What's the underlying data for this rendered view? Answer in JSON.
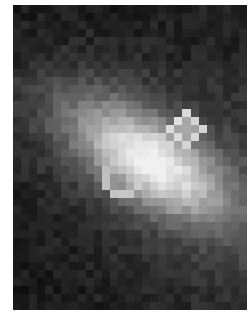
{
  "image": {
    "description": "Pixelated grayscale astronomical image of an elongated galaxy tilted from lower-left to upper-right, with a bright core showing ring-like knots",
    "cols": 29,
    "rows": 38,
    "background_gray": 12,
    "noise_amplitude": 26,
    "galaxy": {
      "center_col": 17.0,
      "center_row": 19.5,
      "major_axis": 13.5,
      "minor_axis": 6.0,
      "angle_deg": -32,
      "peak_gray": 175,
      "halo_gray": 70
    },
    "knots": [
      {
        "col": 21.5,
        "row": 15.5,
        "r": 1.6,
        "rim_gray": 225,
        "inner_gray": 160
      },
      {
        "col": 17.5,
        "row": 18.5,
        "r": 1.8,
        "rim_gray": 215,
        "inner_gray": 150
      },
      {
        "col": 13.5,
        "row": 21.5,
        "r": 2.0,
        "rim_gray": 205,
        "inner_gray": 140
      }
    ],
    "companion": {
      "col": 9.5,
      "row": 12.8,
      "r": 1.3,
      "gray": 95
    }
  }
}
